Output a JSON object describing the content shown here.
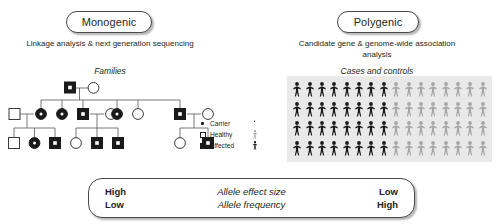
{
  "monogenic": {
    "pill_label": "Monogenic",
    "subtitle": "Linkage analysis & next generation sequencing",
    "section_label": "Families"
  },
  "polygenic": {
    "pill_label": "Polygenic",
    "subtitle": "Candidate gene & genome-wide association analysis",
    "section_label": "Cases and controls"
  },
  "legend": {
    "carrier_label": "Carrier",
    "healthy_label": "Healthy",
    "affected_label": "Affected"
  },
  "cases_controls": {
    "rows": 4,
    "columns": 16,
    "cases_per_row": 8,
    "controls_per_row": 8,
    "total_cases": 32,
    "total_controls": 32,
    "case_color": "#1a1a1a",
    "control_color": "#a6a6a6",
    "panel_color": "#e9e9e9"
  },
  "bottom_bar": {
    "left_top": "High",
    "left_bottom": "Low",
    "middle_top": "Allele effect size",
    "middle_bottom": "Allele frequency",
    "right_top": "Low",
    "right_bottom": "High"
  },
  "pedigree": {
    "generations": 3,
    "symbols": {
      "affected": "filled-square",
      "healthy_male": "open-square",
      "healthy_female": "open-circle",
      "carrier_female": "filled-circle",
      "carrier_mark": "center-dot"
    }
  }
}
